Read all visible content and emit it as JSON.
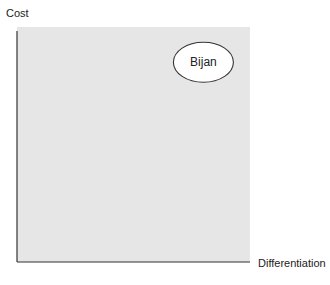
{
  "chart_data": {
    "type": "scatter",
    "title": "",
    "xlabel": "Differentiation",
    "ylabel": "Cost",
    "xlim": [
      0,
      1
    ],
    "ylim": [
      0,
      1
    ],
    "grid": false,
    "legend": "none",
    "points": [
      {
        "label": "Bijan",
        "x": 0.8,
        "y": 0.85
      }
    ]
  },
  "colors": {
    "plot_background": "#e6e6e6",
    "axis": "#333333",
    "node_fill": "#ffffff",
    "node_stroke": "#333333"
  }
}
